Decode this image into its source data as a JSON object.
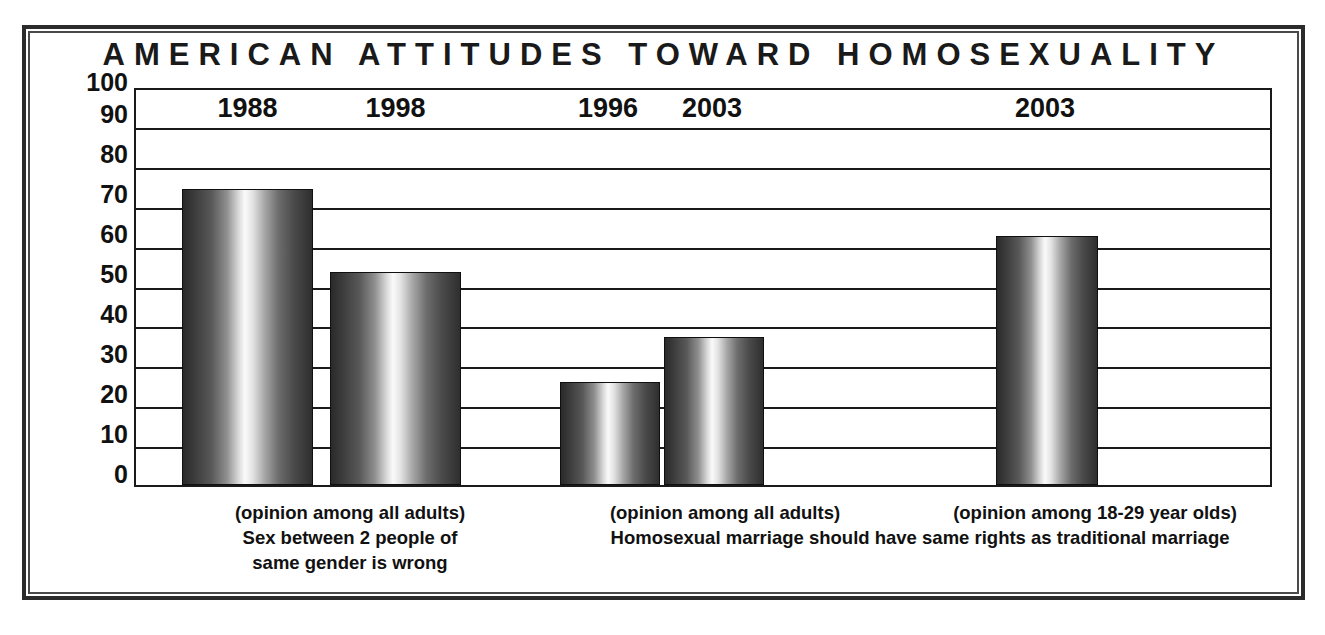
{
  "chart_data": {
    "type": "bar",
    "title": "AMERICAN ATTITUDES TOWARD HOMOSEXUALITY",
    "xlabel": "",
    "ylabel": "",
    "ylim": [
      0,
      100
    ],
    "ytick_step": 10,
    "yticks": [
      "100",
      "90",
      "80",
      "70",
      "60",
      "50",
      "40",
      "30",
      "20",
      "10",
      "0"
    ],
    "grid": true,
    "legend": "none",
    "categories": [
      "1988",
      "1998",
      "1996",
      "2003",
      "2003"
    ],
    "values": [
      75,
      54,
      26,
      37.5,
      63
    ],
    "bars": [
      {
        "label": "1988",
        "value": 75
      },
      {
        "label": "1998",
        "value": 54
      },
      {
        "label": "1996",
        "value": 26
      },
      {
        "label": "2003",
        "value": 37.5
      },
      {
        "label": "2003",
        "value": 63
      }
    ],
    "groups": [
      {
        "question": "Sex between 2 people of same gender is wrong",
        "population": "(opinion among all adults)",
        "bar_indices": [
          0,
          1
        ]
      },
      {
        "question": "Homosexual marriage should have same rights as traditional marriage",
        "population": "(opinion among all adults)",
        "bar_indices": [
          2,
          3
        ]
      },
      {
        "question": "Homosexual marriage should have same rights as traditional marriage",
        "population": "(opinion among 18-29 year olds)",
        "bar_indices": [
          4
        ]
      }
    ],
    "annotations": [
      "(opinion among all adults)",
      "Sex between 2 people of",
      "same gender is wrong",
      "(opinion among all adults)",
      "(opinion among 18-29 year olds)",
      "Homosexual marriage should have same rights as traditional marriage"
    ]
  },
  "captions": {
    "group1": {
      "line1": "(opinion among all adults)",
      "line2": "Sex between 2 people of",
      "line3": "same gender is wrong"
    },
    "group2": {
      "line1": "(opinion among all adults)"
    },
    "group3": {
      "line1": "(opinion among 18-29 year olds)"
    },
    "shared": {
      "line1": "Homosexual marriage should have same rights as traditional marriage"
    }
  },
  "colors": {
    "frame": "#2b2b2b",
    "axis": "#1a1a1a",
    "text": "#111111",
    "bar_dark": "#2a2a2a",
    "bar_light": "#fafafa",
    "background": "#ffffff"
  }
}
